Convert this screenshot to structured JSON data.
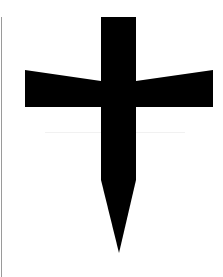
{
  "image": {
    "description": "Black cross / sword-like glyph on white background",
    "symbol": "cross-icon",
    "colors": {
      "background": "#ffffff",
      "shape": "#000000",
      "edge_rule": "#9a9a9a"
    }
  }
}
